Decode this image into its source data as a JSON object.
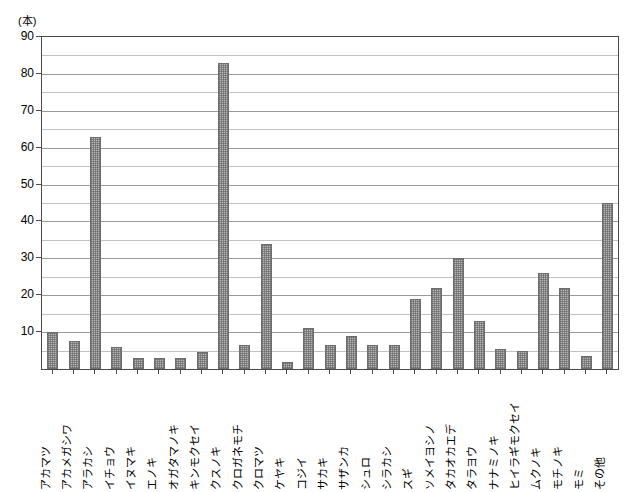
{
  "chart_data": {
    "type": "bar",
    "title": "",
    "subtitle": "",
    "unit_label": "(本)",
    "xlabel": "",
    "ylabel": "",
    "ylim": [
      0,
      90
    ],
    "y_major_step": 10,
    "y_minor_step": 5,
    "grid": true,
    "legend": "none",
    "orientation": "vertical",
    "y_tick_labels": [
      "90",
      "80",
      "70",
      "60",
      "50",
      "40",
      "30",
      "20",
      "10"
    ],
    "y_tick_values": [
      90,
      80,
      70,
      60,
      50,
      40,
      30,
      20,
      10
    ],
    "categories": [
      "アカマツ",
      "アカメガシワ",
      "アラカシ",
      "イチョウ",
      "イヌマキ",
      "エノキ",
      "オガタマノキ",
      "キンモクセイ",
      "クスノキ",
      "クロガネモチ",
      "クロマツ",
      "ケヤキ",
      "コジイ",
      "サカキ",
      "サザンカ",
      "シュロ",
      "シラカシ",
      "スギ",
      "ソメイヨシノ",
      "タカオカエデ",
      "タラヨウ",
      "ナナミノキ",
      "ヒイラギモクセイ",
      "ムクノキ",
      "モチノキ",
      "モミ",
      "その他"
    ],
    "values": [
      10,
      7.5,
      63,
      6,
      3,
      3,
      3,
      4.5,
      83,
      6.5,
      34,
      2,
      11,
      6.5,
      9,
      6.5,
      6.5,
      19,
      22,
      30,
      13,
      5.5,
      5,
      26,
      22,
      3.5,
      45
    ]
  }
}
